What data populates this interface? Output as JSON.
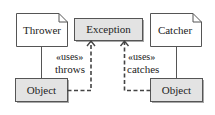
{
  "diagram": {
    "nodes": {
      "thrower": {
        "label": "Thrower",
        "kind": "note"
      },
      "catcher": {
        "label": "Catcher",
        "kind": "note"
      },
      "exception": {
        "label": "Exception",
        "kind": "class"
      },
      "object_left": {
        "label": "Object",
        "kind": "class"
      },
      "object_right": {
        "label": "Object",
        "kind": "class"
      }
    },
    "edges": {
      "left": {
        "stereotype": "«uses»",
        "label": "throws"
      },
      "right": {
        "stereotype": "«uses»",
        "label": "catches"
      }
    },
    "colors": {
      "box_fill": "#e3e3e3",
      "line": "#444444",
      "shadow": "#9a9a9a"
    }
  }
}
